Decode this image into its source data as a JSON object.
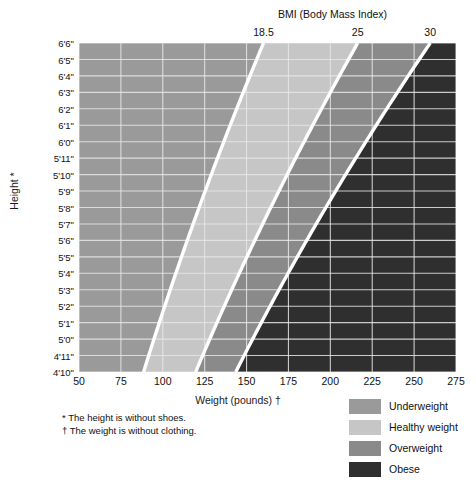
{
  "chart_data": {
    "type": "heatmap",
    "title": "BMI (Body Mass Index)",
    "xlabel": "Weight (pounds) †",
    "ylabel": "Height *",
    "xlim": [
      50,
      275
    ],
    "ylim": [
      58,
      78
    ],
    "grid": true,
    "legend_position": "bottom-right",
    "x_ticks": [
      50,
      75,
      100,
      125,
      150,
      175,
      200,
      225,
      250,
      275
    ],
    "x_tick_labels": [
      "50",
      "75",
      "100",
      "125",
      "150",
      "175",
      "200",
      "225",
      "250",
      "275"
    ],
    "y_tick_labels": [
      "6'6\"",
      "6'5\"",
      "6'4\"",
      "6'3\"",
      "6'2\"",
      "6'1\"",
      "6'0\"",
      "5'11\"",
      "5'10\"",
      "5'9\"",
      "5'8\"",
      "5'7\"",
      "5'6\"",
      "5'5\"",
      "5'4\"",
      "5'3\"",
      "5'2\"",
      "5'1\"",
      "5'0\"",
      "4'11\"",
      "4'10\""
    ],
    "y_tick_inches": [
      78,
      77,
      76,
      75,
      74,
      73,
      72,
      71,
      70,
      69,
      68,
      67,
      66,
      65,
      64,
      63,
      62,
      61,
      60,
      59,
      58
    ],
    "bmi_boundaries": [
      18.5,
      25,
      30
    ],
    "bmi_boundary_labels": [
      "18.5",
      "25",
      "30"
    ],
    "bands": [
      {
        "name": "Underweight",
        "bmi_min": null,
        "bmi_max": 18.5,
        "color": "#9a9a9a"
      },
      {
        "name": "Healthy weight",
        "bmi_min": 18.5,
        "bmi_max": 25,
        "color": "#c6c6c6"
      },
      {
        "name": "Overweight",
        "bmi_min": 25,
        "bmi_max": 30,
        "color": "#8a8a8a"
      },
      {
        "name": "Obese",
        "bmi_min": 30,
        "bmi_max": null,
        "color": "#2f2f2f"
      }
    ],
    "boundary_line_color": "#ffffff",
    "gridline_color": "#e8e8e8"
  },
  "header": {
    "bmi_axis_title": "BMI (Body Mass Index)"
  },
  "axes": {
    "y_title": "Height *",
    "x_title": "Weight (pounds) †"
  },
  "footnotes": [
    "* The height is without shoes.",
    "† The weight is without clothing."
  ],
  "legend": {
    "items": [
      {
        "label": "Underweight",
        "color": "#9a9a9a"
      },
      {
        "label": "Healthy weight",
        "color": "#c6c6c6"
      },
      {
        "label": "Overweight",
        "color": "#8a8a8a"
      },
      {
        "label": "Obese",
        "color": "#2f2f2f"
      }
    ]
  }
}
